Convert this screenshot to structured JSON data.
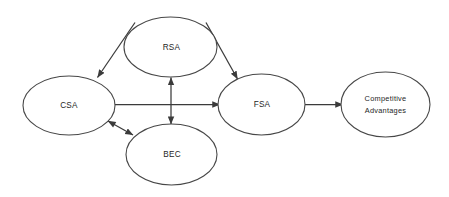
{
  "diagram": {
    "background_color": "#ffffff",
    "stroke_color": "#474747",
    "edge_color": "#3b3b3b",
    "text_color": "#262626",
    "nodes": [
      {
        "id": "csa",
        "label": "CSA",
        "shape": "ellipse",
        "cx": 69,
        "cy": 105.5,
        "rx": 46,
        "ry": 29.5
      },
      {
        "id": "rsa",
        "label": "RSA",
        "shape": "ellipse",
        "cx": 170.5,
        "cy": 47,
        "rx": 46.5,
        "ry": 30
      },
      {
        "id": "bec",
        "label": "BEC",
        "shape": "ellipse",
        "cx": 171.5,
        "cy": 154.5,
        "rx": 45.5,
        "ry": 30.5
      },
      {
        "id": "fsa",
        "label": "FSA",
        "shape": "ellipse",
        "cx": 261.5,
        "cy": 104.5,
        "rx": 43.5,
        "ry": 30.5
      },
      {
        "id": "competitive-advantages",
        "label_line1": "Competitive",
        "label_line2": "Advantages",
        "shape": "ellipse",
        "cx": 385.5,
        "cy": 104.5,
        "rx": 44.5,
        "ry": 32.5
      }
    ],
    "edges": [
      {
        "id": "rsa-to-csa",
        "from": "rsa",
        "to": "csa",
        "direction": "single",
        "arrow_at": "end"
      },
      {
        "id": "rsa-to-fsa",
        "from": "rsa",
        "to": "fsa",
        "direction": "single",
        "arrow_at": "end"
      },
      {
        "id": "rsa-bec-vertical",
        "from": "rsa",
        "to": "bec",
        "direction": "double",
        "arrow_at": "both"
      },
      {
        "id": "csa-to-fsa",
        "from": "csa",
        "to": "fsa",
        "direction": "single",
        "arrow_at": "end"
      },
      {
        "id": "csa-bec",
        "from": "csa",
        "to": "bec",
        "direction": "double",
        "arrow_at": "both"
      },
      {
        "id": "fsa-to-competitive-advantages",
        "from": "fsa",
        "to": "competitive-advantages",
        "direction": "single",
        "arrow_at": "end"
      }
    ]
  }
}
